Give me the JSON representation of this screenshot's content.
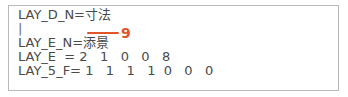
{
  "document": {
    "frame_border_color": "#b9b9b9",
    "background_color": "#ffffff",
    "text_color": "#4a4a4a",
    "lines": [
      {
        "id": "line-1",
        "text": "LAY_D_N=寸法"
      },
      {
        "id": "line-2",
        "text": "|"
      },
      {
        "id": "line-3",
        "text": "LAY_E_N=添景"
      },
      {
        "id": "line-4",
        "text": "LAY_E  = 2   1   0   0   8"
      },
      {
        "id": "line-5",
        "text": "LAY_5_F= 1   1   1   1  0   0   0"
      }
    ]
  },
  "annotation": {
    "color": "#e2542a",
    "number": "9",
    "leader_shape": "horizontal-line"
  }
}
